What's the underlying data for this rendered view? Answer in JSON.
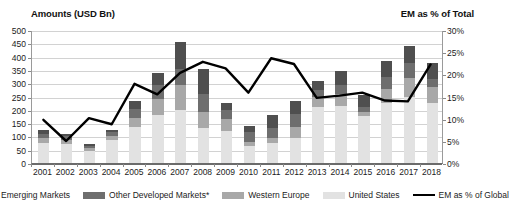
{
  "titles": {
    "left_axis_title": "Amounts (USD Bn)",
    "right_axis_title": "EM as % of Total"
  },
  "legend": [
    {
      "label": "Emerging Markets",
      "marker": "swatch",
      "color": "#4f4f4f"
    },
    {
      "label": "Other Developed Markets*",
      "marker": "swatch",
      "color": "#6e6e6e"
    },
    {
      "label": "Western Europe",
      "marker": "swatch",
      "color": "#a8a8a8"
    },
    {
      "label": "United States",
      "marker": "swatch",
      "color": "#e2e2e2"
    },
    {
      "label": "EM as % of Global",
      "marker": "line",
      "color": "#000000"
    }
  ],
  "chart_data": {
    "type": "bar",
    "title": "Amounts (USD Bn)",
    "subtitle": "EM as % of Total",
    "xlabel": "",
    "ylabel": "Amounts (USD Bn)",
    "y2label": "EM as % of Total",
    "ylim": [
      0,
      500
    ],
    "yticks": [
      "0",
      "50",
      "100",
      "150",
      "200",
      "250",
      "300",
      "350",
      "400",
      "450",
      "500"
    ],
    "y2lim": [
      0,
      30
    ],
    "y2ticks": [
      "0%",
      "5%",
      "10%",
      "15%",
      "20%",
      "25%",
      "30%"
    ],
    "grid": true,
    "legend_position": "bottom",
    "stacked": true,
    "categories": [
      "2001",
      "2002",
      "2003",
      "2004",
      "2005",
      "2006",
      "2007",
      "2008",
      "2009",
      "2010",
      "2011",
      "2012",
      "2013",
      "2014",
      "2015",
      "2016",
      "2017",
      "2018"
    ],
    "series": [
      {
        "name": "United States",
        "color": "#e2e2e2",
        "values": [
          75,
          70,
          45,
          85,
          135,
          180,
          200,
          130,
          120,
          65,
          75,
          95,
          210,
          215,
          175,
          225,
          250,
          225
        ]
      },
      {
        "name": "Western Europe",
        "color": "#a8a8a8",
        "values": [
          20,
          15,
          10,
          15,
          35,
          60,
          95,
          60,
          45,
          15,
          20,
          40,
          40,
          45,
          15,
          55,
          70,
          60
        ]
      },
      {
        "name": "Other Developed Markets*",
        "color": "#6e6e6e",
        "values": [
          15,
          15,
          10,
          15,
          35,
          55,
          60,
          70,
          35,
          35,
          35,
          50,
          25,
          35,
          20,
          45,
          55,
          30
        ]
      },
      {
        "name": "Emerging Markets",
        "color": "#4f4f4f",
        "values": [
          15,
          10,
          5,
          10,
          30,
          45,
          100,
          95,
          25,
          25,
          50,
          50,
          35,
          50,
          45,
          60,
          65,
          60
        ]
      }
    ],
    "line_series": {
      "name": "EM as % of Global",
      "color": "#000000",
      "axis": "right",
      "values": [
        9.8,
        5.0,
        10.2,
        8.8,
        18.0,
        15.6,
        20.5,
        23.0,
        21.5,
        16.0,
        23.8,
        22.5,
        14.8,
        15.3,
        16.0,
        14.2,
        14.0,
        22.4
      ]
    },
    "footnote_marker": "*"
  }
}
